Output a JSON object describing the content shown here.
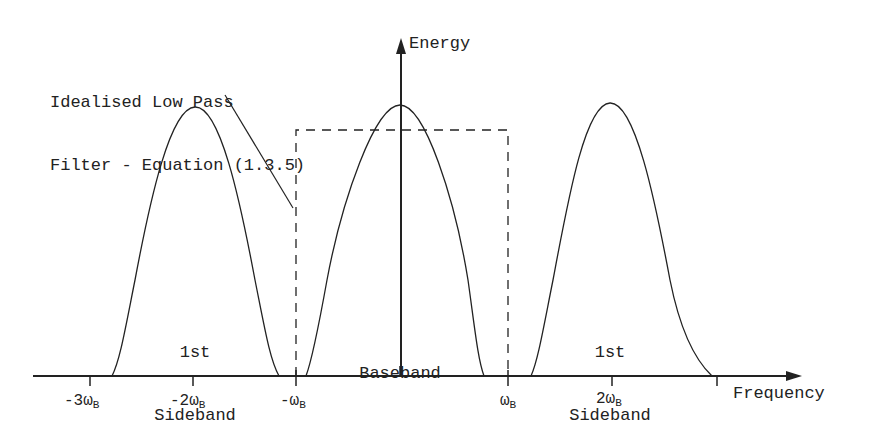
{
  "diagram": {
    "annotation": {
      "line1": "Idealised Low Pass",
      "line2": "Filter - Equation (1.3.5)"
    },
    "y_axis_label": "Energy",
    "x_axis_label": "Frequency",
    "bands": [
      {
        "line1": "1st",
        "line2": "Sideband"
      },
      {
        "line1": "",
        "line2": "Baseband"
      },
      {
        "line1": "1st",
        "line2": "Sideband"
      }
    ],
    "ticks": [
      {
        "prefix": "-3ω",
        "sub": "B"
      },
      {
        "prefix": "-2ω",
        "sub": "B"
      },
      {
        "prefix": "-ω",
        "sub": "B"
      },
      {
        "prefix": "ω",
        "sub": "B"
      },
      {
        "prefix": "2ω",
        "sub": "B"
      }
    ],
    "colors": {
      "ink": "#222222",
      "background": "#ffffff"
    }
  }
}
